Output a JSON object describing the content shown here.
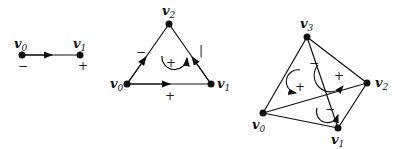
{
  "diagrams": [
    {
      "name": "1-simplex",
      "vertices": [
        {
          "label": "v",
          "sub": "0",
          "sign": "−"
        },
        {
          "label": "v",
          "sub": "1",
          "sign": "+"
        }
      ]
    },
    {
      "name": "2-simplex",
      "vertices": [
        {
          "label": "v",
          "sub": "0"
        },
        {
          "label": "v",
          "sub": "1"
        },
        {
          "label": "v",
          "sub": "2"
        }
      ],
      "edge_signs": {
        "left": "−",
        "right": "|",
        "bottom": "+"
      },
      "orientation_sign": "+"
    },
    {
      "name": "3-simplex",
      "vertices": [
        {
          "label": "v",
          "sub": "0"
        },
        {
          "label": "v",
          "sub": "1"
        },
        {
          "label": "v",
          "sub": "2"
        },
        {
          "label": "v",
          "sub": "3"
        }
      ],
      "face_signs": [
        "−",
        "+",
        "+",
        "−"
      ]
    }
  ]
}
